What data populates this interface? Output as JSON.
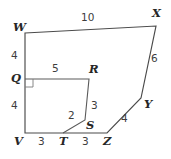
{
  "figure": {
    "kind": "geometry-polygon-diagram",
    "canvas": {
      "width": 171,
      "height": 159
    },
    "background_color": "#ffffff",
    "stroke_color": "#4a4a4a",
    "label_color": "#2f2f2f",
    "outer_polygon": {
      "name": "WXYZTV",
      "closed": true,
      "vertices": [
        {
          "label": "W",
          "x": 25,
          "y": 33
        },
        {
          "label": "X",
          "x": 156,
          "y": 26
        },
        {
          "label": "Y",
          "x": 141,
          "y": 98
        },
        {
          "label": "Z",
          "x": 107,
          "y": 133
        },
        {
          "label": "V",
          "x": 25,
          "y": 133
        }
      ]
    },
    "inner_polyline": {
      "name": "Q-R-S-T",
      "vertices": [
        {
          "label": "Q",
          "x": 25,
          "y": 79
        },
        {
          "label": "R",
          "x": 89,
          "y": 79
        },
        {
          "label": "S",
          "x": 85,
          "y": 120
        },
        {
          "label": "T",
          "x": 63,
          "y": 133
        }
      ]
    },
    "right_angle_marker": {
      "at_vertex": "Q",
      "x": 25,
      "y": 79,
      "size": 8
    },
    "vertex_labels": [
      {
        "name": "vertex-label-w",
        "text": "W",
        "x": 13,
        "y": 22
      },
      {
        "name": "vertex-label-x",
        "text": "X",
        "x": 152,
        "y": 8
      },
      {
        "name": "vertex-label-y",
        "text": "Y",
        "x": 144,
        "y": 99
      },
      {
        "name": "vertex-label-z",
        "text": "Z",
        "x": 103,
        "y": 136
      },
      {
        "name": "vertex-label-v",
        "text": "V",
        "x": 14,
        "y": 136
      },
      {
        "name": "vertex-label-q",
        "text": "Q",
        "x": 11,
        "y": 73
      },
      {
        "name": "vertex-label-r",
        "text": "R",
        "x": 89,
        "y": 64
      },
      {
        "name": "vertex-label-s",
        "text": "S",
        "x": 86,
        "y": 120
      },
      {
        "name": "vertex-label-t",
        "text": "T",
        "x": 59,
        "y": 136
      }
    ],
    "side_lengths": [
      {
        "name": "length-wx",
        "segment": "WX",
        "text": "10",
        "x": 81,
        "y": 12
      },
      {
        "name": "length-xy",
        "segment": "XY",
        "text": "6",
        "x": 151,
        "y": 53
      },
      {
        "name": "length-yz",
        "segment": "YZ",
        "text": "4",
        "x": 121,
        "y": 113
      },
      {
        "name": "length-zt",
        "segment": "ZT",
        "text": "3",
        "x": 82,
        "y": 136
      },
      {
        "name": "length-tv",
        "segment": "TV",
        "text": "3",
        "x": 38,
        "y": 136
      },
      {
        "name": "length-vq",
        "segment": "VQ",
        "text": "4",
        "x": 11,
        "y": 100
      },
      {
        "name": "length-qw",
        "segment": "QW",
        "text": "4",
        "x": 11,
        "y": 50
      },
      {
        "name": "length-qr",
        "segment": "QR",
        "text": "5",
        "x": 52,
        "y": 63
      },
      {
        "name": "length-rs",
        "segment": "RS",
        "text": "3",
        "x": 91,
        "y": 100
      },
      {
        "name": "length-st",
        "segment": "ST",
        "text": "2",
        "x": 68,
        "y": 110
      }
    ]
  }
}
